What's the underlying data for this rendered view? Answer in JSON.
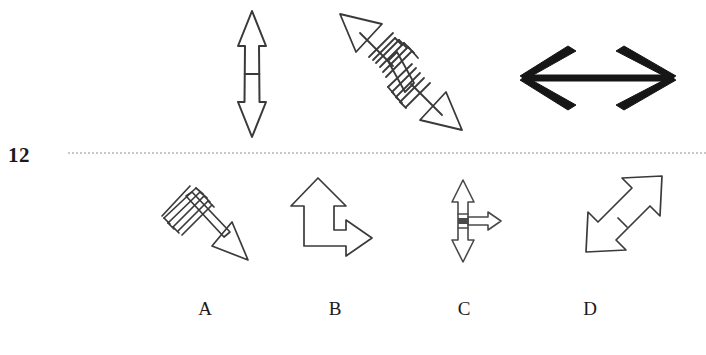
{
  "item": {
    "number": "12",
    "type": "visual-analogy-arrow-puzzle"
  },
  "separator": {
    "style": "dotted",
    "color": "#c8c8cc"
  },
  "colors": {
    "ink": "#1a1a1a",
    "outline": "#3a3a3a",
    "background": "#ffffff",
    "dotted_rule": "#c8c8cc"
  },
  "stem": {
    "label": "stem-figures",
    "figures": [
      {
        "id": "stem-1",
        "name": "vertical-double-arrow-with-crossbar",
        "description": "Outline double-headed arrow pointing up and down with a horizontal crossbar at the midpoint",
        "orientation": "vertical",
        "heads": 2,
        "fill": "none",
        "stroke": "#3a3a3a"
      },
      {
        "id": "stem-2",
        "name": "diagonal-double-arrow-with-fletching",
        "description": "Outline double-headed arrow on the up-left / down-right diagonal with hatched feather fletching at the centre",
        "orientation": "diagonal-nw-se",
        "heads": 2,
        "fill": "none",
        "stroke": "#3a3a3a"
      },
      {
        "id": "stem-3",
        "name": "bold-horizontal-double-arrow",
        "description": "Heavy solid black double-headed arrow pointing left and right with open chevron heads",
        "orientation": "horizontal",
        "heads": 2,
        "fill": "#161616",
        "stroke": "#161616"
      }
    ]
  },
  "options": {
    "label": "answer-options",
    "items": [
      {
        "letter": "A",
        "id": "option-a",
        "name": "diagonal-single-arrow-with-fletching",
        "description": "Outline single-headed arrow pointing down-right with hatched feather fletching at the up-left tail",
        "heads": 1
      },
      {
        "letter": "B",
        "id": "option-b",
        "name": "bent-double-arrow-up-right",
        "description": "Outline L-shaped double arrow with one head pointing up and one head pointing right",
        "heads": 2
      },
      {
        "letter": "C",
        "id": "option-c",
        "name": "vertical-double-arrow-with-right-branch",
        "description": "Narrow vertical double-headed arrow with a short horizontal arrow branching to the right",
        "heads": 3
      },
      {
        "letter": "D",
        "id": "option-d",
        "name": "diagonal-double-arrow-with-crossbar",
        "description": "Outline double-headed arrow on the up-right / down-left diagonal with a crossbar at the midpoint",
        "heads": 2
      }
    ]
  }
}
